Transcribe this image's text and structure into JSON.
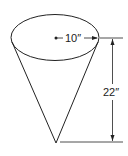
{
  "diagram": {
    "shape": "cone",
    "radius_label": "10″",
    "height_label": "22″",
    "stroke_color": "#222222",
    "background": "#ffffff"
  }
}
